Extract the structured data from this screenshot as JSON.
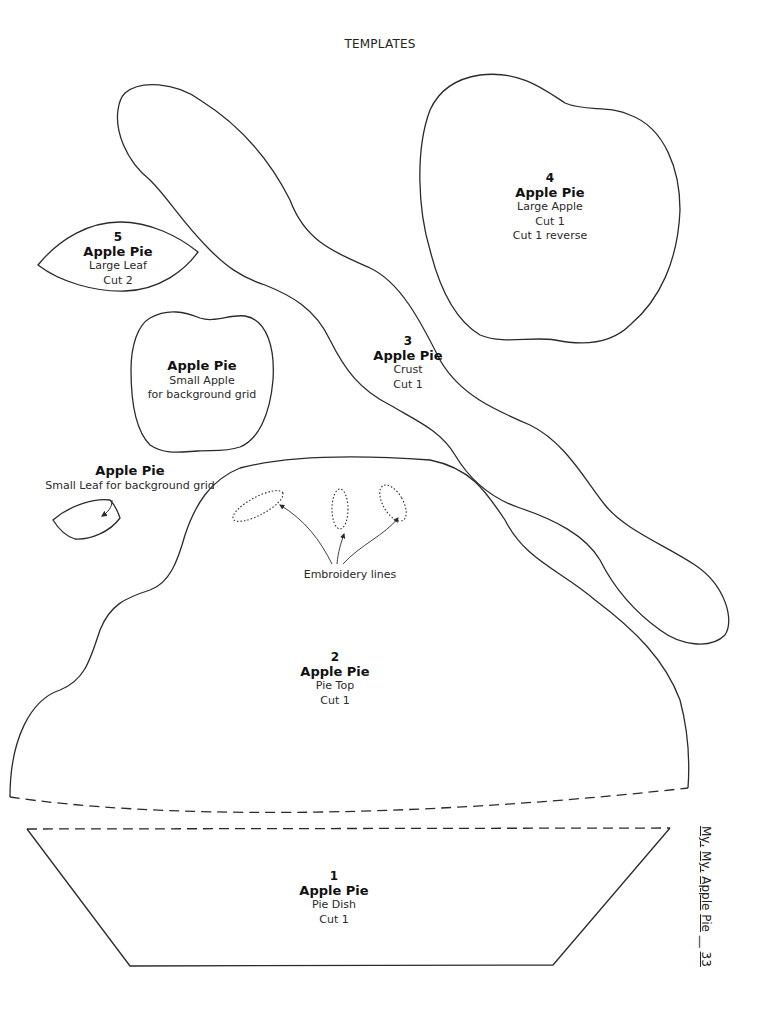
{
  "page": {
    "title": "TEMPLATES",
    "footer": {
      "book_title_parts": [
        "My,",
        "My,",
        "Apple",
        "Pie"
      ],
      "separator": "__",
      "page_number": "33"
    }
  },
  "templates": [
    {
      "id": "1",
      "number": "1",
      "name": "Apple Pie",
      "piece": "Pie Dish",
      "instructions": [
        "Cut 1"
      ]
    },
    {
      "id": "2",
      "number": "2",
      "name": "Apple Pie",
      "piece": "Pie Top",
      "instructions": [
        "Cut 1"
      ]
    },
    {
      "id": "3",
      "number": "3",
      "name": "Apple Pie",
      "piece": "Crust",
      "instructions": [
        "Cut 1"
      ]
    },
    {
      "id": "4",
      "number": "4",
      "name": "Apple Pie",
      "piece": "Large Apple",
      "instructions": [
        "Cut 1",
        "Cut 1 reverse"
      ]
    },
    {
      "id": "5",
      "number": "5",
      "name": "Apple Pie",
      "piece": "Large Leaf",
      "instructions": [
        "Cut 2"
      ]
    },
    {
      "id": "small-apple",
      "name": "Apple Pie",
      "piece": "Small Apple",
      "instructions": [
        "for background grid"
      ]
    },
    {
      "id": "small-leaf",
      "name": "Apple Pie",
      "piece": "Small Leaf for background grid",
      "instructions": []
    }
  ],
  "annotations": {
    "embroidery": "Embroidery lines"
  },
  "colors": {
    "line": "#2b2b2b",
    "background": "#ffffff"
  }
}
